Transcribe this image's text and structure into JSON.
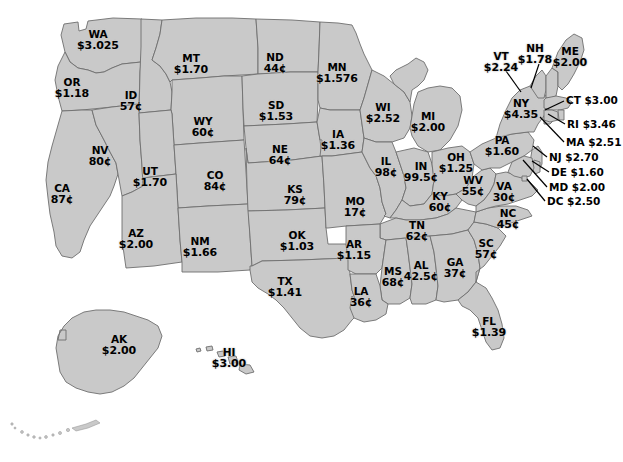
{
  "figure": {
    "type": "choropleth-map",
    "region": "United States",
    "value_unit": "dollars and cents per unit",
    "fill_color": "#c9c9c9",
    "border_color": "#6e6e6e",
    "background_color": "#ffffff",
    "caption_fragment": ""
  },
  "states": [
    {
      "code": "WA",
      "value": "$3.025",
      "x": 98,
      "y": 40,
      "layout": "stack"
    },
    {
      "code": "OR",
      "value": "$1.18",
      "x": 72,
      "y": 88,
      "layout": "stack"
    },
    {
      "code": "ID",
      "value": "57¢",
      "x": 131,
      "y": 101,
      "layout": "stack"
    },
    {
      "code": "MT",
      "value": "$1.70",
      "x": 191,
      "y": 64,
      "layout": "stack"
    },
    {
      "code": "WY",
      "value": "60¢",
      "x": 203,
      "y": 127,
      "layout": "stack"
    },
    {
      "code": "ND",
      "value": "44¢",
      "x": 275,
      "y": 63,
      "layout": "stack"
    },
    {
      "code": "SD",
      "value": "$1.53",
      "x": 276,
      "y": 111,
      "layout": "stack"
    },
    {
      "code": "NE",
      "value": "64¢",
      "x": 280,
      "y": 155,
      "layout": "stack"
    },
    {
      "code": "KS",
      "value": "79¢",
      "x": 295,
      "y": 195,
      "layout": "stack"
    },
    {
      "code": "MN",
      "value": "$1.576",
      "x": 337,
      "y": 73,
      "layout": "stack"
    },
    {
      "code": "IA",
      "value": "$1.36",
      "x": 338,
      "y": 140,
      "layout": "stack"
    },
    {
      "code": "MO",
      "value": "17¢",
      "x": 355,
      "y": 207,
      "layout": "stack"
    },
    {
      "code": "WI",
      "value": "$2.52",
      "x": 383,
      "y": 113,
      "layout": "stack"
    },
    {
      "code": "IL",
      "value": "98¢",
      "x": 386,
      "y": 167,
      "layout": "stack"
    },
    {
      "code": "MI",
      "value": "$2.00",
      "x": 428,
      "y": 122,
      "layout": "stack"
    },
    {
      "code": "IN",
      "value": "99.5¢",
      "x": 421,
      "y": 172,
      "layout": "stack"
    },
    {
      "code": "OH",
      "value": "$1.25",
      "x": 456,
      "y": 163,
      "layout": "stack"
    },
    {
      "code": "KY",
      "value": "60¢",
      "x": 440,
      "y": 202,
      "layout": "stack"
    },
    {
      "code": "WV",
      "value": "55¢",
      "x": 473,
      "y": 186,
      "layout": "stack"
    },
    {
      "code": "TN",
      "value": "62¢",
      "x": 417,
      "y": 231,
      "layout": "stack"
    },
    {
      "code": "NV",
      "value": "80¢",
      "x": 100,
      "y": 156,
      "layout": "stack"
    },
    {
      "code": "UT",
      "value": "$1.70",
      "x": 150,
      "y": 177,
      "layout": "stack"
    },
    {
      "code": "CA",
      "value": "87¢",
      "x": 62,
      "y": 194,
      "layout": "stack"
    },
    {
      "code": "CO",
      "value": "84¢",
      "x": 215,
      "y": 181,
      "layout": "stack"
    },
    {
      "code": "AZ",
      "value": "$2.00",
      "x": 136,
      "y": 239,
      "layout": "stack"
    },
    {
      "code": "NM",
      "value": "$1.66",
      "x": 200,
      "y": 247,
      "layout": "stack"
    },
    {
      "code": "OK",
      "value": "$1.03",
      "x": 297,
      "y": 241,
      "layout": "stack"
    },
    {
      "code": "TX",
      "value": "$1.41",
      "x": 285,
      "y": 287,
      "layout": "stack"
    },
    {
      "code": "AR",
      "value": "$1.15",
      "x": 354,
      "y": 250,
      "layout": "stack"
    },
    {
      "code": "LA",
      "value": "36¢",
      "x": 361,
      "y": 297,
      "layout": "stack"
    },
    {
      "code": "MS",
      "value": "68¢",
      "x": 393,
      "y": 277,
      "layout": "stack"
    },
    {
      "code": "AL",
      "value": "42.5¢",
      "x": 421,
      "y": 271,
      "layout": "stack"
    },
    {
      "code": "GA",
      "value": "37¢",
      "x": 455,
      "y": 268,
      "layout": "stack"
    },
    {
      "code": "SC",
      "value": "57¢",
      "x": 486,
      "y": 249,
      "layout": "stack"
    },
    {
      "code": "NC",
      "value": "45¢",
      "x": 508,
      "y": 219,
      "layout": "stack"
    },
    {
      "code": "VA",
      "value": "30¢",
      "x": 504,
      "y": 192,
      "layout": "stack"
    },
    {
      "code": "FL",
      "value": "$1.39",
      "x": 489,
      "y": 327,
      "layout": "stack"
    },
    {
      "code": "PA",
      "value": "$1.60",
      "x": 502,
      "y": 146,
      "layout": "stack"
    },
    {
      "code": "NY",
      "value": "$4.35",
      "x": 521,
      "y": 109,
      "layout": "stack"
    },
    {
      "code": "VT",
      "value": "$2.24",
      "x": 501,
      "y": 62,
      "layout": "stack"
    },
    {
      "code": "NH",
      "value": "$1.78",
      "x": 535,
      "y": 54,
      "layout": "stack"
    },
    {
      "code": "ME",
      "value": "$2.00",
      "x": 570,
      "y": 57,
      "layout": "stack"
    },
    {
      "code": "AK",
      "value": "$2.00",
      "x": 119,
      "y": 345,
      "layout": "stack"
    },
    {
      "code": "HI",
      "value": "$3.00",
      "x": 229,
      "y": 358,
      "layout": "stack"
    }
  ],
  "callouts": [
    {
      "code": "CT",
      "value": "$3.00",
      "x": 566,
      "y": 101,
      "lx1": 564,
      "ly1": 101,
      "lx2": 545,
      "ly2": 110
    },
    {
      "code": "RI",
      "value": "$3.46",
      "x": 567,
      "y": 125,
      "lx1": 565,
      "ly1": 124,
      "lx2": 548,
      "ly2": 115
    },
    {
      "code": "MA",
      "value": "$2.51",
      "x": 566,
      "y": 143,
      "lx1": 564,
      "ly1": 142,
      "lx2": 540,
      "ly2": 118
    },
    {
      "code": "NJ",
      "value": "$2.70",
      "x": 549,
      "y": 158,
      "lx1": 547,
      "ly1": 157,
      "lx2": 533,
      "ly2": 145
    },
    {
      "code": "DE",
      "value": "$1.60",
      "x": 551,
      "y": 173,
      "lx1": 549,
      "ly1": 172,
      "lx2": 531,
      "ly2": 160
    },
    {
      "code": "MD",
      "value": "$2.00",
      "x": 549,
      "y": 188,
      "lx1": 547,
      "ly1": 187,
      "lx2": 523,
      "ly2": 159
    },
    {
      "code": "DC",
      "value": "$2.50",
      "x": 547,
      "y": 202,
      "lx1": 545,
      "ly1": 201,
      "lx2": 526,
      "ly2": 178
    }
  ],
  "leaders": [
    {
      "name": "vt-leader",
      "x1": 506,
      "y1": 71,
      "x2": 521,
      "y2": 92
    },
    {
      "name": "nh-leader",
      "x1": 539,
      "y1": 64,
      "x2": 531,
      "y2": 88
    }
  ]
}
